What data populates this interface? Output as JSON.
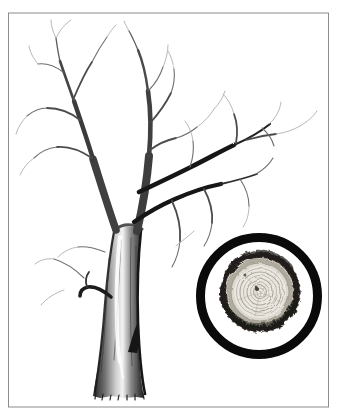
{
  "figure": {
    "kind": "pencil-illustration",
    "inset_subject": "trunk-cross-section-with-growth-rings",
    "visible_text": ""
  },
  "palette": {
    "paper": "#ffffff",
    "frame": "#8c8c8c",
    "pencil_dark": "#161616",
    "pencil_mid": "#4a4a4a",
    "pencil_light": "#a6a6a6",
    "magnifier_ring": "#0a0a0a",
    "bark": "#221f1b",
    "sapwood": "#dcd8cf",
    "midwood": "#8d8779",
    "heartwood": "#eae7e0",
    "growth_ring": "#a09a8e",
    "pith": "#47413a"
  },
  "frame": {
    "x": 8.5,
    "y": 13,
    "width": 320,
    "height": 394
  },
  "inset": {
    "ring_center_x": 259,
    "ring_center_y": 296,
    "ring_radius": 58.5,
    "ring_stroke": 9,
    "section_center_x": 260,
    "section_center_y": 292,
    "bark_radius": 37,
    "bark_stroke": 6,
    "midwood_radius": 31,
    "heartwood_radius": 26,
    "growth_ring_radii": [
      29,
      23.5,
      20,
      16.5,
      13,
      9.5,
      6.5,
      4
    ],
    "pith_x": 257,
    "pith_y": 289,
    "pith_radius": 2.1,
    "knot_x": 245,
    "knot_y": 275,
    "knot_radius": 1.5
  }
}
